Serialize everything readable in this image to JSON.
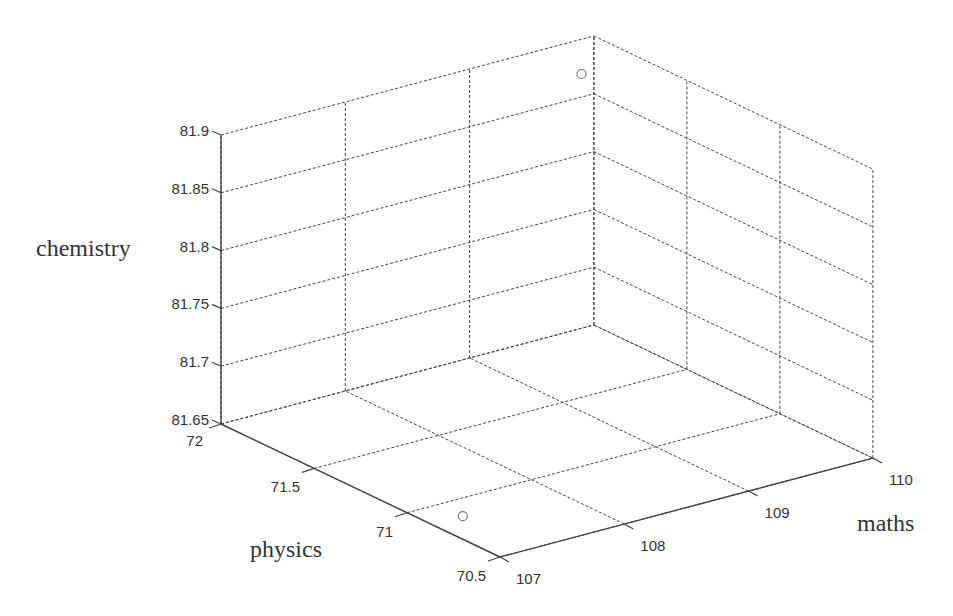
{
  "chart_data": {
    "type": "scatter",
    "title": "",
    "dimensions": 3,
    "xlabel": "maths",
    "ylabel": "physics",
    "zlabel": "chemistry",
    "xlim": [
      107,
      110
    ],
    "ylim": [
      70.5,
      72
    ],
    "zlim": [
      81.65,
      81.9
    ],
    "xticks": [
      "107",
      "108",
      "109",
      "110"
    ],
    "yticks": [
      "70.5",
      "71",
      "71.5",
      "72"
    ],
    "zticks": [
      "81.65",
      "81.7",
      "81.75",
      "81.8",
      "81.85",
      "81.9"
    ],
    "grid": true,
    "legend": null,
    "marker": "circle-open",
    "series": [
      {
        "name": "students",
        "points": [
          {
            "maths": 109.9,
            "physics": 72.0,
            "chemistry": 81.87
          },
          {
            "maths": 107.0,
            "physics": 70.7,
            "chemistry": 81.67
          }
        ]
      }
    ]
  },
  "colors": {
    "axis": "#444444",
    "grid": "#444444",
    "marker": "#777777",
    "text": "#333333",
    "background": "#ffffff"
  },
  "projection": {
    "origin_px": [
      221,
      424
    ],
    "maths_unit_px": [
      124.3,
      -33.0
    ],
    "physics_unit_px": [
      -186.0,
      -88.7
    ],
    "chem_per_unit_px": [
      0,
      -1156
    ]
  }
}
